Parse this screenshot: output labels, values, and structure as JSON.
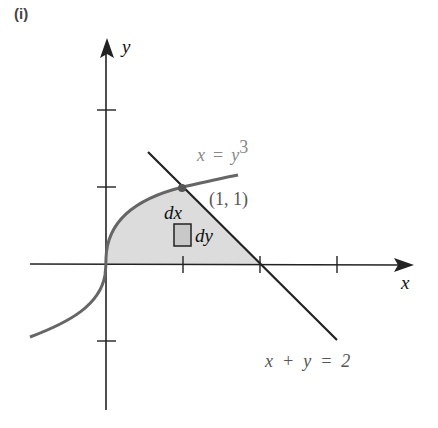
{
  "panel_label": "(i)",
  "axes": {
    "x_label": "x",
    "y_label": "y",
    "origin_px": [
      106,
      264
    ],
    "unit_px": 77,
    "x_ticks": [
      1,
      2,
      3
    ],
    "y_ticks": [
      -1,
      1,
      2
    ]
  },
  "curves": {
    "cubic": {
      "label_lhs": "x",
      "label_eq": "=",
      "label_rhs": "y",
      "label_exp": "3",
      "color": "#666666"
    },
    "line": {
      "label": "x  +  y  =  2",
      "color": "#222222"
    }
  },
  "point": {
    "label": "(1, 1)",
    "x": 1,
    "y": 1
  },
  "element": {
    "dx_label": "dx",
    "dy_label": "dy"
  },
  "region_fill": "#dcdcdc"
}
